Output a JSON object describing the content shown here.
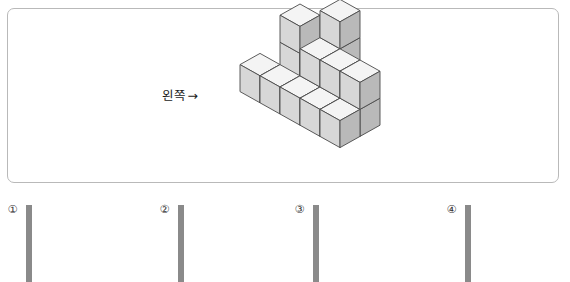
{
  "figure": {
    "direction_label": "왼쪽",
    "direction_arrow": "→",
    "cube_colors": {
      "top_face": "#f4f4f4",
      "left_face": "#d7d7d7",
      "right_face": "#b9b9b9",
      "outline": "#4a4a4a"
    },
    "cubes": [
      {
        "x": 0,
        "y": 0,
        "z": 0
      },
      {
        "x": 1,
        "y": 0,
        "z": 0
      },
      {
        "x": 2,
        "y": 0,
        "z": 0
      },
      {
        "x": 2,
        "y": 1,
        "z": 0
      },
      {
        "x": 2,
        "y": 2,
        "z": 0
      },
      {
        "x": 0,
        "y": 2,
        "z": 0
      },
      {
        "x": 1,
        "y": 2,
        "z": 0
      },
      {
        "x": 3,
        "y": 1,
        "z": 0
      },
      {
        "x": 3,
        "y": 2,
        "z": 0
      },
      {
        "x": 4,
        "y": 1,
        "z": 0
      },
      {
        "x": 4,
        "y": 2,
        "z": 0
      },
      {
        "x": 0,
        "y": 0,
        "z": 1
      },
      {
        "x": 2,
        "y": 0,
        "z": 1
      },
      {
        "x": 2,
        "y": 1,
        "z": 1
      },
      {
        "x": 3,
        "y": 1,
        "z": 1
      },
      {
        "x": 4,
        "y": 1,
        "z": 1
      },
      {
        "x": 2,
        "y": 0,
        "z": 2
      }
    ]
  },
  "options": [
    {
      "number": "①",
      "name": "option-1",
      "rows": 4,
      "cols": 5,
      "filled": [
        [
          false,
          false,
          false,
          false,
          false
        ],
        [
          false,
          false,
          false,
          false,
          false
        ],
        [
          true,
          false,
          true,
          false,
          false
        ],
        [
          true,
          true,
          true,
          false,
          false
        ]
      ]
    },
    {
      "number": "②",
      "name": "option-2",
      "rows": 4,
      "cols": 5,
      "filled": [
        [
          false,
          false,
          false,
          false,
          false
        ],
        [
          false,
          false,
          false,
          false,
          false
        ],
        [
          true,
          true,
          true,
          false,
          false
        ],
        [
          true,
          true,
          true,
          false,
          false
        ]
      ]
    },
    {
      "number": "③",
      "name": "option-3",
      "rows": 4,
      "cols": 5,
      "filled": [
        [
          false,
          false,
          false,
          false,
          false
        ],
        [
          false,
          false,
          false,
          false,
          false
        ],
        [
          false,
          false,
          true,
          false,
          true
        ],
        [
          false,
          false,
          true,
          true,
          true
        ]
      ]
    },
    {
      "number": "④",
      "name": "option-4",
      "rows": 4,
      "cols": 5,
      "filled": [
        [
          false,
          false,
          false,
          false,
          false
        ],
        [
          false,
          false,
          false,
          false,
          false
        ],
        [
          true,
          false,
          true,
          false,
          false
        ],
        [
          true,
          true,
          true,
          false,
          true
        ]
      ]
    }
  ]
}
